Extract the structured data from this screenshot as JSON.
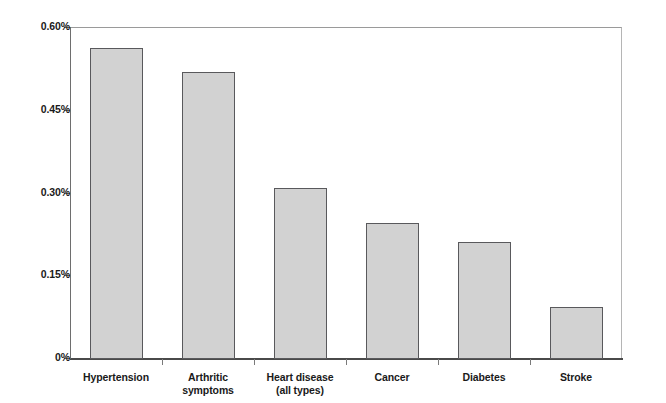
{
  "chart_data": {
    "type": "bar",
    "title": "",
    "subtitle": "",
    "xlabel": "",
    "ylabel": "",
    "categories": [
      "Hypertension",
      "Arthritic symptoms",
      "Heart disease\n(all types)",
      "Cancer",
      "Diabetes",
      "Stroke"
    ],
    "values": [
      0.562,
      0.519,
      0.309,
      0.244,
      0.211,
      0.092
    ],
    "value_unit": "%",
    "ylim": [
      0,
      0.6
    ],
    "yticks": [
      0,
      0.15,
      0.3,
      0.45,
      0.6
    ],
    "ytick_labels": [
      "0%",
      "0.15%",
      "0.30%",
      "0.45%",
      "0.60%"
    ],
    "grid": false,
    "legend": false,
    "legend_position": "none",
    "bar_fill_color": "#d2d2d2",
    "bar_border_color": "#59595c",
    "axis_color": "#6e6e6e",
    "text_color": "#1a1a1a",
    "background_color": "#ffffff"
  }
}
